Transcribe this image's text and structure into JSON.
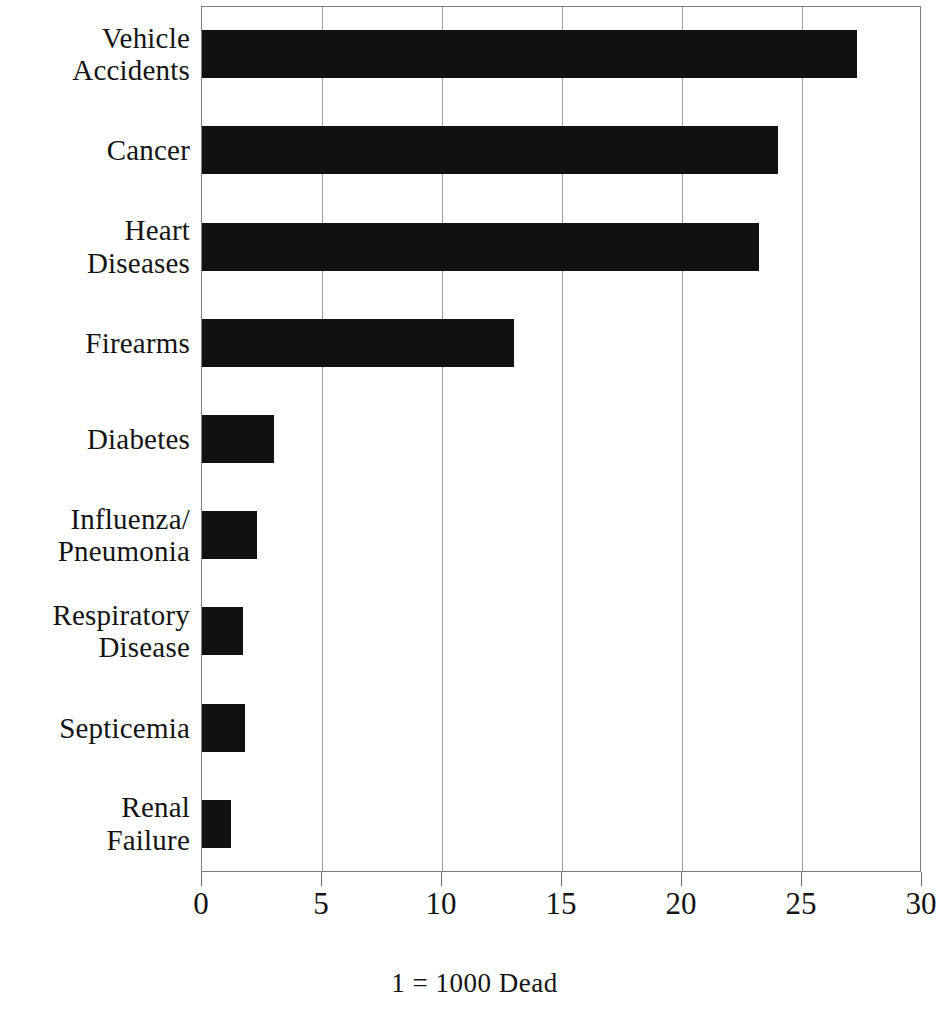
{
  "chart_data": {
    "type": "bar",
    "orientation": "horizontal",
    "title": "",
    "subtitle": "",
    "xlabel": "",
    "ylabel": "",
    "caption": "1 = 1000 Dead",
    "unit_note": "1 = 1000 Dead",
    "xlim": [
      0,
      30
    ],
    "ylim": null,
    "grid": true,
    "grid_axis": "x",
    "legend": null,
    "legend_position": "none",
    "xticks": [
      0,
      5,
      10,
      15,
      20,
      25,
      30
    ],
    "xtick_labels": [
      "0",
      "5",
      "10",
      "15",
      "20",
      "25",
      "30"
    ],
    "categories": [
      "Vehicle Accidents",
      "Cancer",
      "Heart Diseases",
      "Firearms",
      "Diabetes",
      "Influenza/ Pneumonia",
      "Respiratory Disease",
      "Septicemia",
      "Renal Failure"
    ],
    "category_lines": [
      [
        "Vehicle",
        "Accidents"
      ],
      [
        "Cancer"
      ],
      [
        "Heart",
        "Diseases"
      ],
      [
        "Firearms"
      ],
      [
        "Diabetes"
      ],
      [
        "Influenza/",
        "Pneumonia"
      ],
      [
        "Respiratory",
        "Disease"
      ],
      [
        "Septicemia"
      ],
      [
        "Renal",
        "Failure"
      ]
    ],
    "values": [
      27.3,
      24.0,
      23.2,
      13.0,
      3.0,
      2.3,
      1.7,
      1.8,
      1.2
    ],
    "bar_color": "#111111",
    "background_color": "#ffffff",
    "axis_color": "#7d7d7d"
  },
  "figure": {
    "caption_text": "1 = 1000 Dead"
  }
}
